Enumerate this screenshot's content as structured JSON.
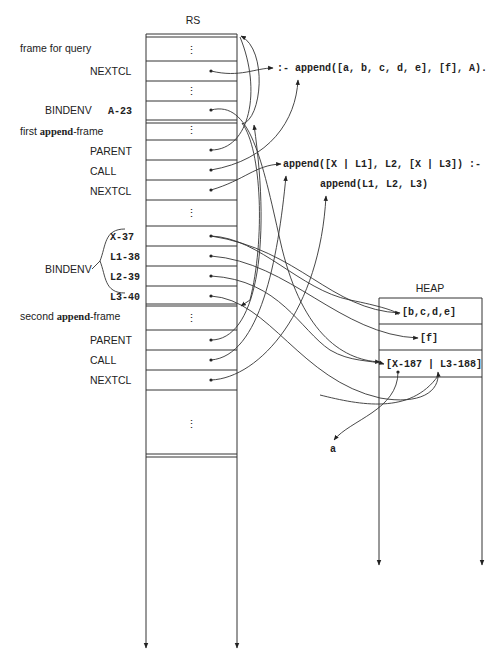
{
  "rs": {
    "title": "RS",
    "labels": {
      "frame_for_query": "frame for query",
      "nextcl_1": "NEXTCL",
      "bindenv_1": "BINDENV",
      "bindenv_1_value": "A-23",
      "first_frame_prefix": "first ",
      "first_frame_bold": "append",
      "first_frame_suffix": "-frame",
      "parent_1": "PARENT",
      "call_1": "CALL",
      "nextcl_2": "NEXTCL",
      "bindenv_2": "BINDENV",
      "bindenv_vars": [
        "X-37",
        "L1-38",
        "L2-39",
        "L3-40"
      ],
      "second_frame_prefix": "second ",
      "second_frame_bold": "append",
      "second_frame_suffix": "-frame",
      "parent_2": "PARENT",
      "call_2": "CALL",
      "nextcl_3": "NEXTCL"
    },
    "ellipsis": "⋮"
  },
  "heap": {
    "title": "HEAP",
    "cells": [
      "[b,c,d,e]",
      "[f]",
      "[X-187 | L3-188]"
    ]
  },
  "code": {
    "query": ":- append([a, b, c, d, e], [f], A).",
    "clause_head": "append([X | L1], L2, [X | L3]) :-",
    "clause_body": "append(L1, L2, L3)"
  },
  "atom_a": "a"
}
